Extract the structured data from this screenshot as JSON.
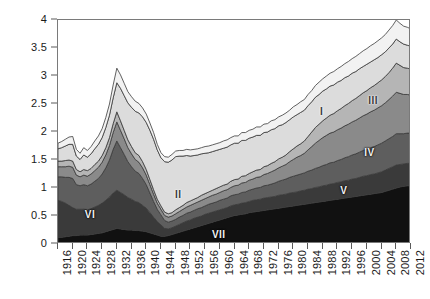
{
  "chart_data": {
    "type": "area",
    "title": "",
    "subtitle": "",
    "xlabel": "",
    "ylabel": "",
    "stacked": true,
    "grid": false,
    "legend_position": "inline-labels",
    "xlim": [
      1916,
      2012
    ],
    "ylim": [
      0,
      4
    ],
    "yticks": [
      0,
      0.5,
      1,
      1.5,
      2,
      2.5,
      3,
      3.5,
      4
    ],
    "ytick_labels": [
      "0",
      "0.5",
      "1",
      "1.5",
      "2",
      "2.5",
      "3",
      "3.5",
      "4"
    ],
    "xticks": [
      1916,
      1920,
      1924,
      1928,
      1932,
      1936,
      1940,
      1944,
      1948,
      1952,
      1956,
      1960,
      1964,
      1968,
      1972,
      1976,
      1980,
      1984,
      1988,
      1992,
      1996,
      2000,
      2004,
      2008,
      2012
    ],
    "xtick_labels": [
      "1916",
      "1920",
      "1924",
      "1928",
      "1932",
      "1936",
      "1940",
      "1944",
      "1948",
      "1952",
      "1956",
      "1960",
      "1964",
      "1968",
      "1972",
      "1976",
      "1980",
      "1984",
      "1988",
      "1992",
      "1996",
      "2000",
      "2004",
      "2008",
      "2012"
    ],
    "x": [
      1916,
      1917,
      1918,
      1919,
      1920,
      1921,
      1922,
      1923,
      1924,
      1925,
      1926,
      1927,
      1928,
      1929,
      1930,
      1931,
      1932,
      1933,
      1934,
      1935,
      1936,
      1937,
      1938,
      1939,
      1940,
      1941,
      1942,
      1943,
      1944,
      1945,
      1946,
      1947,
      1948,
      1949,
      1950,
      1951,
      1952,
      1953,
      1954,
      1955,
      1956,
      1957,
      1958,
      1959,
      1960,
      1961,
      1962,
      1963,
      1964,
      1965,
      1966,
      1967,
      1968,
      1969,
      1970,
      1971,
      1972,
      1973,
      1974,
      1975,
      1976,
      1977,
      1978,
      1979,
      1980,
      1981,
      1982,
      1983,
      1984,
      1985,
      1986,
      1987,
      1988,
      1989,
      1990,
      1991,
      1992,
      1993,
      1994,
      1995,
      1996,
      1997,
      1998,
      1999,
      2000,
      2001,
      2002,
      2003,
      2004,
      2005,
      2006,
      2007,
      2008,
      2009,
      2010,
      2011,
      2012
    ],
    "series": [
      {
        "name": "VII",
        "label": "VII",
        "color": "#111111",
        "label_color": "light-on-dark",
        "label_x": 1960,
        "label_y": 0.16,
        "values": [
          0.12,
          0.12,
          0.13,
          0.14,
          0.15,
          0.15,
          0.16,
          0.16,
          0.16,
          0.17,
          0.18,
          0.19,
          0.2,
          0.22,
          0.24,
          0.26,
          0.28,
          0.27,
          0.26,
          0.25,
          0.25,
          0.24,
          0.24,
          0.23,
          0.22,
          0.2,
          0.18,
          0.16,
          0.14,
          0.14,
          0.15,
          0.17,
          0.19,
          0.21,
          0.23,
          0.25,
          0.27,
          0.29,
          0.31,
          0.33,
          0.35,
          0.37,
          0.39,
          0.41,
          0.43,
          0.45,
          0.47,
          0.49,
          0.51,
          0.52,
          0.53,
          0.54,
          0.56,
          0.57,
          0.58,
          0.59,
          0.6,
          0.61,
          0.62,
          0.63,
          0.64,
          0.65,
          0.66,
          0.67,
          0.68,
          0.69,
          0.7,
          0.71,
          0.72,
          0.73,
          0.74,
          0.75,
          0.76,
          0.77,
          0.78,
          0.79,
          0.8,
          0.81,
          0.82,
          0.83,
          0.84,
          0.85,
          0.86,
          0.87,
          0.88,
          0.89,
          0.9,
          0.91,
          0.92,
          0.94,
          0.96,
          0.98,
          1.0,
          1.02,
          1.03,
          1.04,
          1.04
        ]
      },
      {
        "name": "VI",
        "label": "VI",
        "color": "#3a3a3a",
        "label_color": "light-on-dark",
        "label_x": 1925,
        "label_y": 0.52,
        "values": [
          0.66,
          0.64,
          0.6,
          0.55,
          0.5,
          0.47,
          0.46,
          0.46,
          0.45,
          0.46,
          0.48,
          0.5,
          0.53,
          0.56,
          0.6,
          0.65,
          0.68,
          0.65,
          0.62,
          0.58,
          0.55,
          0.52,
          0.5,
          0.46,
          0.42,
          0.36,
          0.3,
          0.24,
          0.2,
          0.14,
          0.12,
          0.12,
          0.13,
          0.14,
          0.15,
          0.16,
          0.16,
          0.17,
          0.17,
          0.17,
          0.18,
          0.18,
          0.18,
          0.18,
          0.18,
          0.18,
          0.18,
          0.19,
          0.19,
          0.19,
          0.2,
          0.2,
          0.2,
          0.21,
          0.21,
          0.21,
          0.22,
          0.22,
          0.22,
          0.22,
          0.23,
          0.23,
          0.23,
          0.24,
          0.24,
          0.24,
          0.25,
          0.25,
          0.26,
          0.26,
          0.27,
          0.27,
          0.28,
          0.28,
          0.29,
          0.29,
          0.3,
          0.3,
          0.31,
          0.31,
          0.32,
          0.32,
          0.33,
          0.34,
          0.34,
          0.35,
          0.35,
          0.36,
          0.37,
          0.38,
          0.39,
          0.4,
          0.41,
          0.4,
          0.4,
          0.4,
          0.4
        ]
      },
      {
        "name": "V",
        "label": "V",
        "color": "#5e5e5e",
        "label_color": "light-on-dark",
        "label_x": 1994,
        "label_y": 0.95,
        "values": [
          0.42,
          0.44,
          0.46,
          0.5,
          0.52,
          0.44,
          0.42,
          0.44,
          0.43,
          0.44,
          0.46,
          0.48,
          0.52,
          0.58,
          0.66,
          0.78,
          0.88,
          0.8,
          0.72,
          0.64,
          0.58,
          0.54,
          0.52,
          0.48,
          0.42,
          0.35,
          0.28,
          0.22,
          0.18,
          0.14,
          0.12,
          0.12,
          0.12,
          0.13,
          0.13,
          0.14,
          0.14,
          0.14,
          0.15,
          0.15,
          0.15,
          0.16,
          0.16,
          0.16,
          0.17,
          0.17,
          0.17,
          0.18,
          0.18,
          0.18,
          0.19,
          0.19,
          0.2,
          0.2,
          0.21,
          0.21,
          0.22,
          0.22,
          0.23,
          0.24,
          0.25,
          0.26,
          0.27,
          0.28,
          0.29,
          0.3,
          0.3,
          0.31,
          0.32,
          0.33,
          0.34,
          0.35,
          0.36,
          0.37,
          0.38,
          0.38,
          0.39,
          0.4,
          0.41,
          0.42,
          0.43,
          0.44,
          0.45,
          0.46,
          0.47,
          0.48,
          0.49,
          0.5,
          0.51,
          0.52,
          0.53,
          0.54,
          0.56,
          0.55,
          0.54,
          0.54,
          0.54
        ]
      },
      {
        "name": "IV",
        "label": "IV",
        "color": "#8a8a8a",
        "label_color": "light-on-dark",
        "label_x": 2001,
        "label_y": 1.62,
        "values": [
          0.18,
          0.18,
          0.19,
          0.2,
          0.2,
          0.17,
          0.16,
          0.17,
          0.17,
          0.18,
          0.19,
          0.2,
          0.21,
          0.23,
          0.26,
          0.3,
          0.34,
          0.31,
          0.28,
          0.25,
          0.23,
          0.21,
          0.2,
          0.19,
          0.17,
          0.15,
          0.13,
          0.11,
          0.1,
          0.09,
          0.09,
          0.09,
          0.1,
          0.1,
          0.11,
          0.11,
          0.12,
          0.12,
          0.12,
          0.13,
          0.13,
          0.13,
          0.14,
          0.14,
          0.14,
          0.15,
          0.15,
          0.15,
          0.16,
          0.16,
          0.17,
          0.17,
          0.18,
          0.18,
          0.19,
          0.19,
          0.2,
          0.21,
          0.22,
          0.23,
          0.24,
          0.25,
          0.26,
          0.28,
          0.3,
          0.32,
          0.33,
          0.35,
          0.38,
          0.42,
          0.45,
          0.48,
          0.5,
          0.52,
          0.53,
          0.54,
          0.55,
          0.56,
          0.57,
          0.58,
          0.59,
          0.6,
          0.61,
          0.62,
          0.63,
          0.64,
          0.65,
          0.66,
          0.67,
          0.68,
          0.7,
          0.72,
          0.74,
          0.72,
          0.7,
          0.69,
          0.68
        ]
      },
      {
        "name": "III",
        "label": "III",
        "color": "#b5b5b5",
        "label_color": "dark-on-light",
        "label_x": 2002,
        "label_y": 2.55,
        "values": [
          0.1,
          0.1,
          0.11,
          0.11,
          0.11,
          0.1,
          0.09,
          0.1,
          0.1,
          0.1,
          0.11,
          0.11,
          0.12,
          0.13,
          0.14,
          0.16,
          0.18,
          0.17,
          0.15,
          0.14,
          0.13,
          0.12,
          0.12,
          0.11,
          0.1,
          0.09,
          0.08,
          0.07,
          0.06,
          0.06,
          0.06,
          0.06,
          0.07,
          0.07,
          0.07,
          0.08,
          0.08,
          0.08,
          0.08,
          0.09,
          0.09,
          0.09,
          0.09,
          0.1,
          0.1,
          0.1,
          0.1,
          0.11,
          0.11,
          0.11,
          0.12,
          0.12,
          0.12,
          0.13,
          0.13,
          0.13,
          0.14,
          0.14,
          0.15,
          0.15,
          0.16,
          0.16,
          0.17,
          0.18,
          0.19,
          0.2,
          0.21,
          0.22,
          0.24,
          0.26,
          0.28,
          0.29,
          0.3,
          0.31,
          0.32,
          0.33,
          0.34,
          0.35,
          0.36,
          0.37,
          0.38,
          0.39,
          0.4,
          0.41,
          0.42,
          0.43,
          0.44,
          0.45,
          0.46,
          0.47,
          0.48,
          0.5,
          0.52,
          0.5,
          0.48,
          0.47,
          0.46
        ]
      },
      {
        "name": "II",
        "label": "II",
        "color": "#dcdcdc",
        "label_color": "dark-on-light",
        "label_x": 1949,
        "label_y": 0.88,
        "values": [
          0.22,
          0.24,
          0.26,
          0.28,
          0.3,
          0.24,
          0.22,
          0.26,
          0.24,
          0.26,
          0.28,
          0.3,
          0.32,
          0.36,
          0.4,
          0.46,
          0.52,
          0.58,
          0.62,
          0.66,
          0.7,
          0.74,
          0.76,
          0.8,
          0.84,
          0.88,
          0.9,
          0.88,
          0.86,
          0.9,
          0.92,
          0.94,
          0.95,
          0.92,
          0.88,
          0.84,
          0.8,
          0.78,
          0.76,
          0.74,
          0.72,
          0.7,
          0.69,
          0.68,
          0.67,
          0.66,
          0.66,
          0.65,
          0.65,
          0.64,
          0.64,
          0.63,
          0.63,
          0.62,
          0.62,
          0.61,
          0.61,
          0.6,
          0.6,
          0.59,
          0.59,
          0.58,
          0.58,
          0.57,
          0.57,
          0.56,
          0.56,
          0.55,
          0.55,
          0.54,
          0.54,
          0.53,
          0.53,
          0.52,
          0.52,
          0.51,
          0.51,
          0.5,
          0.5,
          0.49,
          0.49,
          0.48,
          0.48,
          0.47,
          0.47,
          0.46,
          0.46,
          0.45,
          0.45,
          0.44,
          0.44,
          0.43,
          0.43,
          0.42,
          0.42,
          0.41,
          0.41
        ]
      },
      {
        "name": "I",
        "label": "I",
        "color": "#f2f2f2",
        "label_color": "dark-on-light",
        "label_x": 1988,
        "label_y": 2.35,
        "values": [
          0.1,
          0.11,
          0.12,
          0.13,
          0.14,
          0.12,
          0.11,
          0.13,
          0.12,
          0.13,
          0.14,
          0.15,
          0.16,
          0.18,
          0.2,
          0.23,
          0.26,
          0.24,
          0.22,
          0.2,
          0.19,
          0.18,
          0.17,
          0.16,
          0.15,
          0.13,
          0.12,
          0.1,
          0.09,
          0.09,
          0.09,
          0.1,
          0.1,
          0.1,
          0.1,
          0.11,
          0.11,
          0.11,
          0.11,
          0.11,
          0.12,
          0.12,
          0.12,
          0.12,
          0.12,
          0.13,
          0.13,
          0.13,
          0.13,
          0.13,
          0.14,
          0.14,
          0.14,
          0.14,
          0.15,
          0.15,
          0.15,
          0.15,
          0.16,
          0.16,
          0.16,
          0.17,
          0.17,
          0.17,
          0.18,
          0.18,
          0.19,
          0.19,
          0.2,
          0.2,
          0.21,
          0.22,
          0.22,
          0.23,
          0.23,
          0.24,
          0.24,
          0.25,
          0.25,
          0.26,
          0.26,
          0.27,
          0.27,
          0.28,
          0.28,
          0.29,
          0.29,
          0.3,
          0.3,
          0.31,
          0.32,
          0.33,
          0.34,
          0.33,
          0.32,
          0.32,
          0.31
        ]
      }
    ]
  },
  "style": {
    "axis_color": "#7a7a7a",
    "tick_color": "#5a5a5a",
    "text_color": "#1a1a1a",
    "outline_color": "#3a3a3a",
    "background": "#ffffff"
  }
}
